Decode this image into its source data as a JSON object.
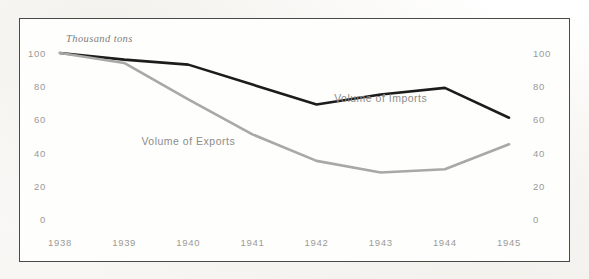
{
  "figure": {
    "unit_caption": "Thousand tons",
    "frame_color": "#4a4a4a",
    "background_color": "#fefefd"
  },
  "chart_data": {
    "type": "line",
    "title": "",
    "subtitle": "",
    "xlabel": "",
    "ylabel": "Thousand tons",
    "categories": [
      "1938",
      "1939",
      "1940",
      "1941",
      "1942",
      "1943",
      "1944",
      "1945"
    ],
    "x": [
      1938,
      1939,
      1940,
      1941,
      1942,
      1943,
      1944,
      1945
    ],
    "ylim": [
      0,
      100
    ],
    "yticks": [
      0,
      20,
      40,
      60,
      80,
      100
    ],
    "ytick_labels_left": [
      "100",
      "80",
      "60",
      "40",
      "20",
      "0"
    ],
    "ytick_labels_right": [
      "100",
      "80",
      "60",
      "40",
      "20",
      "0"
    ],
    "xtick_labels": [
      "1938",
      "1939",
      "1940",
      "1941",
      "1942",
      "1943",
      "1944",
      "1945"
    ],
    "grid": false,
    "legend": "inline-annotations",
    "series": [
      {
        "name": "Volume of Imports",
        "color": "#1c1c1c",
        "line_width": 2.6,
        "values": [
          100,
          96,
          93,
          81,
          69,
          75,
          79,
          61
        ]
      },
      {
        "name": "Volume of Exports",
        "color": "#a8a8a6",
        "line_width": 2.6,
        "values": [
          100,
          94,
          72,
          51,
          35,
          28,
          30,
          45
        ]
      }
    ],
    "annotations": [
      {
        "text": "Volume of Imports",
        "x": 1943,
        "y": 73
      },
      {
        "text": "Volume of Exports",
        "x": 1940,
        "y": 47
      },
      {
        "text": "Thousand tons",
        "x": 1938,
        "y": 104
      }
    ]
  }
}
